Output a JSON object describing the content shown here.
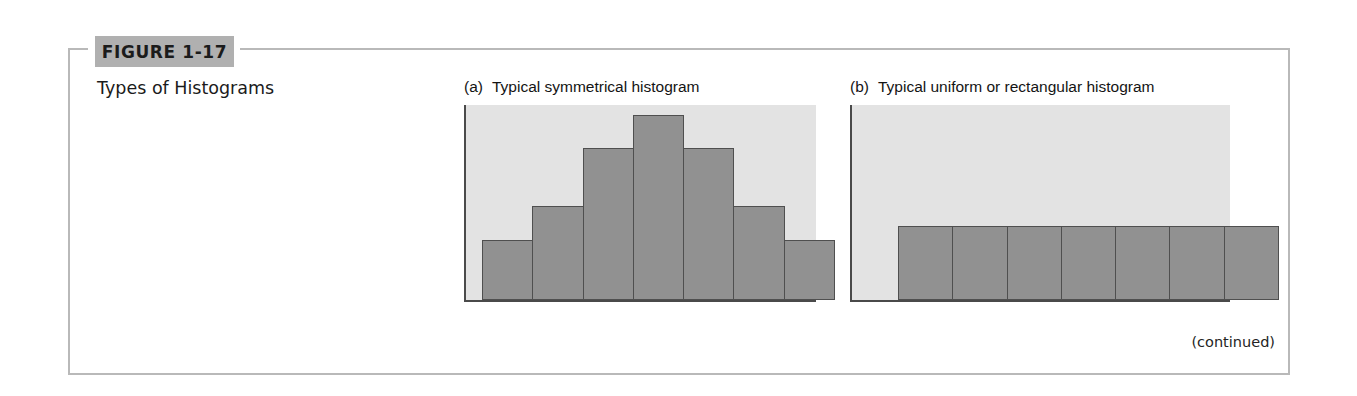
{
  "figure": {
    "label": "FIGURE 1-17",
    "title": "Types of Histograms",
    "continued_note": "(continued)",
    "band_color": "#b0b0b0",
    "frame_color": "#b9b9b9"
  },
  "panels": [
    {
      "id": "a",
      "marker": "(a)",
      "caption": "Typical symmetrical histogram"
    },
    {
      "id": "b",
      "marker": "(b)",
      "caption": "Typical uniform or rectangular histogram"
    }
  ],
  "chart_data": [
    {
      "type": "bar",
      "title": "(a)  Typical symmetrical histogram",
      "xlabel": "",
      "ylabel": "",
      "categories": [
        "1",
        "2",
        "3",
        "4",
        "5",
        "6",
        "7"
      ],
      "values": [
        31,
        48,
        78,
        95,
        78,
        48,
        31
      ],
      "ylim": [
        0,
        100
      ],
      "grid": false,
      "legend": "none",
      "bar_color": "#919191",
      "bar_edge_color": "#4f4f4f",
      "plot_background": "#e3e3e3",
      "axis_color": "#4a4a4a"
    },
    {
      "type": "bar",
      "title": "(b)  Typical uniform or rectangular histogram",
      "xlabel": "",
      "ylabel": "",
      "categories": [
        "1",
        "2",
        "3",
        "4",
        "5",
        "6",
        "7"
      ],
      "values": [
        38,
        38,
        38,
        38,
        38,
        38,
        38
      ],
      "ylim": [
        0,
        100
      ],
      "grid": false,
      "legend": "none",
      "bar_color": "#919191",
      "bar_edge_color": "#4f4f4f",
      "plot_background": "#e3e3e3",
      "axis_color": "#4a4a4a"
    }
  ]
}
